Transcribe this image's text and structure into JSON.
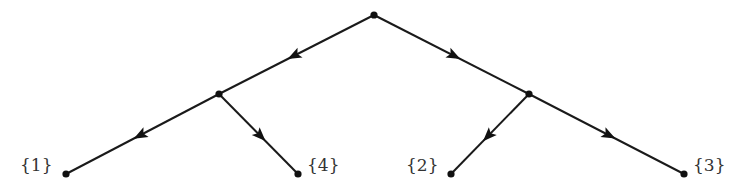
{
  "diagram": {
    "type": "tree",
    "directed": true,
    "edge_color": "#1a1a1a",
    "node_color": "#111111",
    "label_color": "#333333",
    "nodes": [
      {
        "id": "root",
        "x": 374,
        "y": 15,
        "label": ""
      },
      {
        "id": "left",
        "x": 219,
        "y": 94,
        "label": ""
      },
      {
        "id": "right",
        "x": 529,
        "y": 94,
        "label": ""
      },
      {
        "id": "leaf1",
        "x": 66,
        "y": 174,
        "label": "{1}",
        "label_side": "left"
      },
      {
        "id": "leaf4",
        "x": 298,
        "y": 174,
        "label": "{4}",
        "label_side": "right"
      },
      {
        "id": "leaf2",
        "x": 451,
        "y": 174,
        "label": "{2}",
        "label_side": "left"
      },
      {
        "id": "leaf3",
        "x": 684,
        "y": 174,
        "label": "{3}",
        "label_side": "right"
      }
    ],
    "edges": [
      {
        "from": "root",
        "to": "left"
      },
      {
        "from": "root",
        "to": "right"
      },
      {
        "from": "left",
        "to": "leaf1"
      },
      {
        "from": "left",
        "to": "leaf4"
      },
      {
        "from": "right",
        "to": "leaf2"
      },
      {
        "from": "right",
        "to": "leaf3"
      }
    ],
    "leaf_labels": {
      "leaf1": "{1}",
      "leaf4": "{4}",
      "leaf2": "{2}",
      "leaf3": "{3}"
    }
  }
}
